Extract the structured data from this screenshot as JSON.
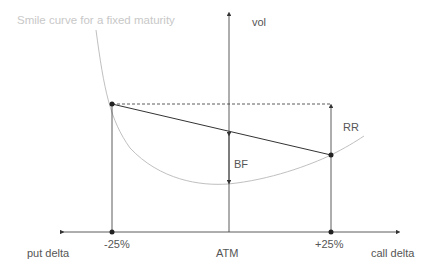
{
  "title": "Smile curve for a fixed maturity",
  "axes": {
    "y_label": "vol",
    "x_left_label": "put delta",
    "x_right_label": "call delta"
  },
  "ticks": {
    "left": "-25%",
    "center": "ATM",
    "right": "+25%"
  },
  "annotations": {
    "rr": "RR",
    "bf": "BF"
  },
  "colors": {
    "axis": "#333333",
    "curve": "#c0c0c0",
    "text": "#555555"
  }
}
